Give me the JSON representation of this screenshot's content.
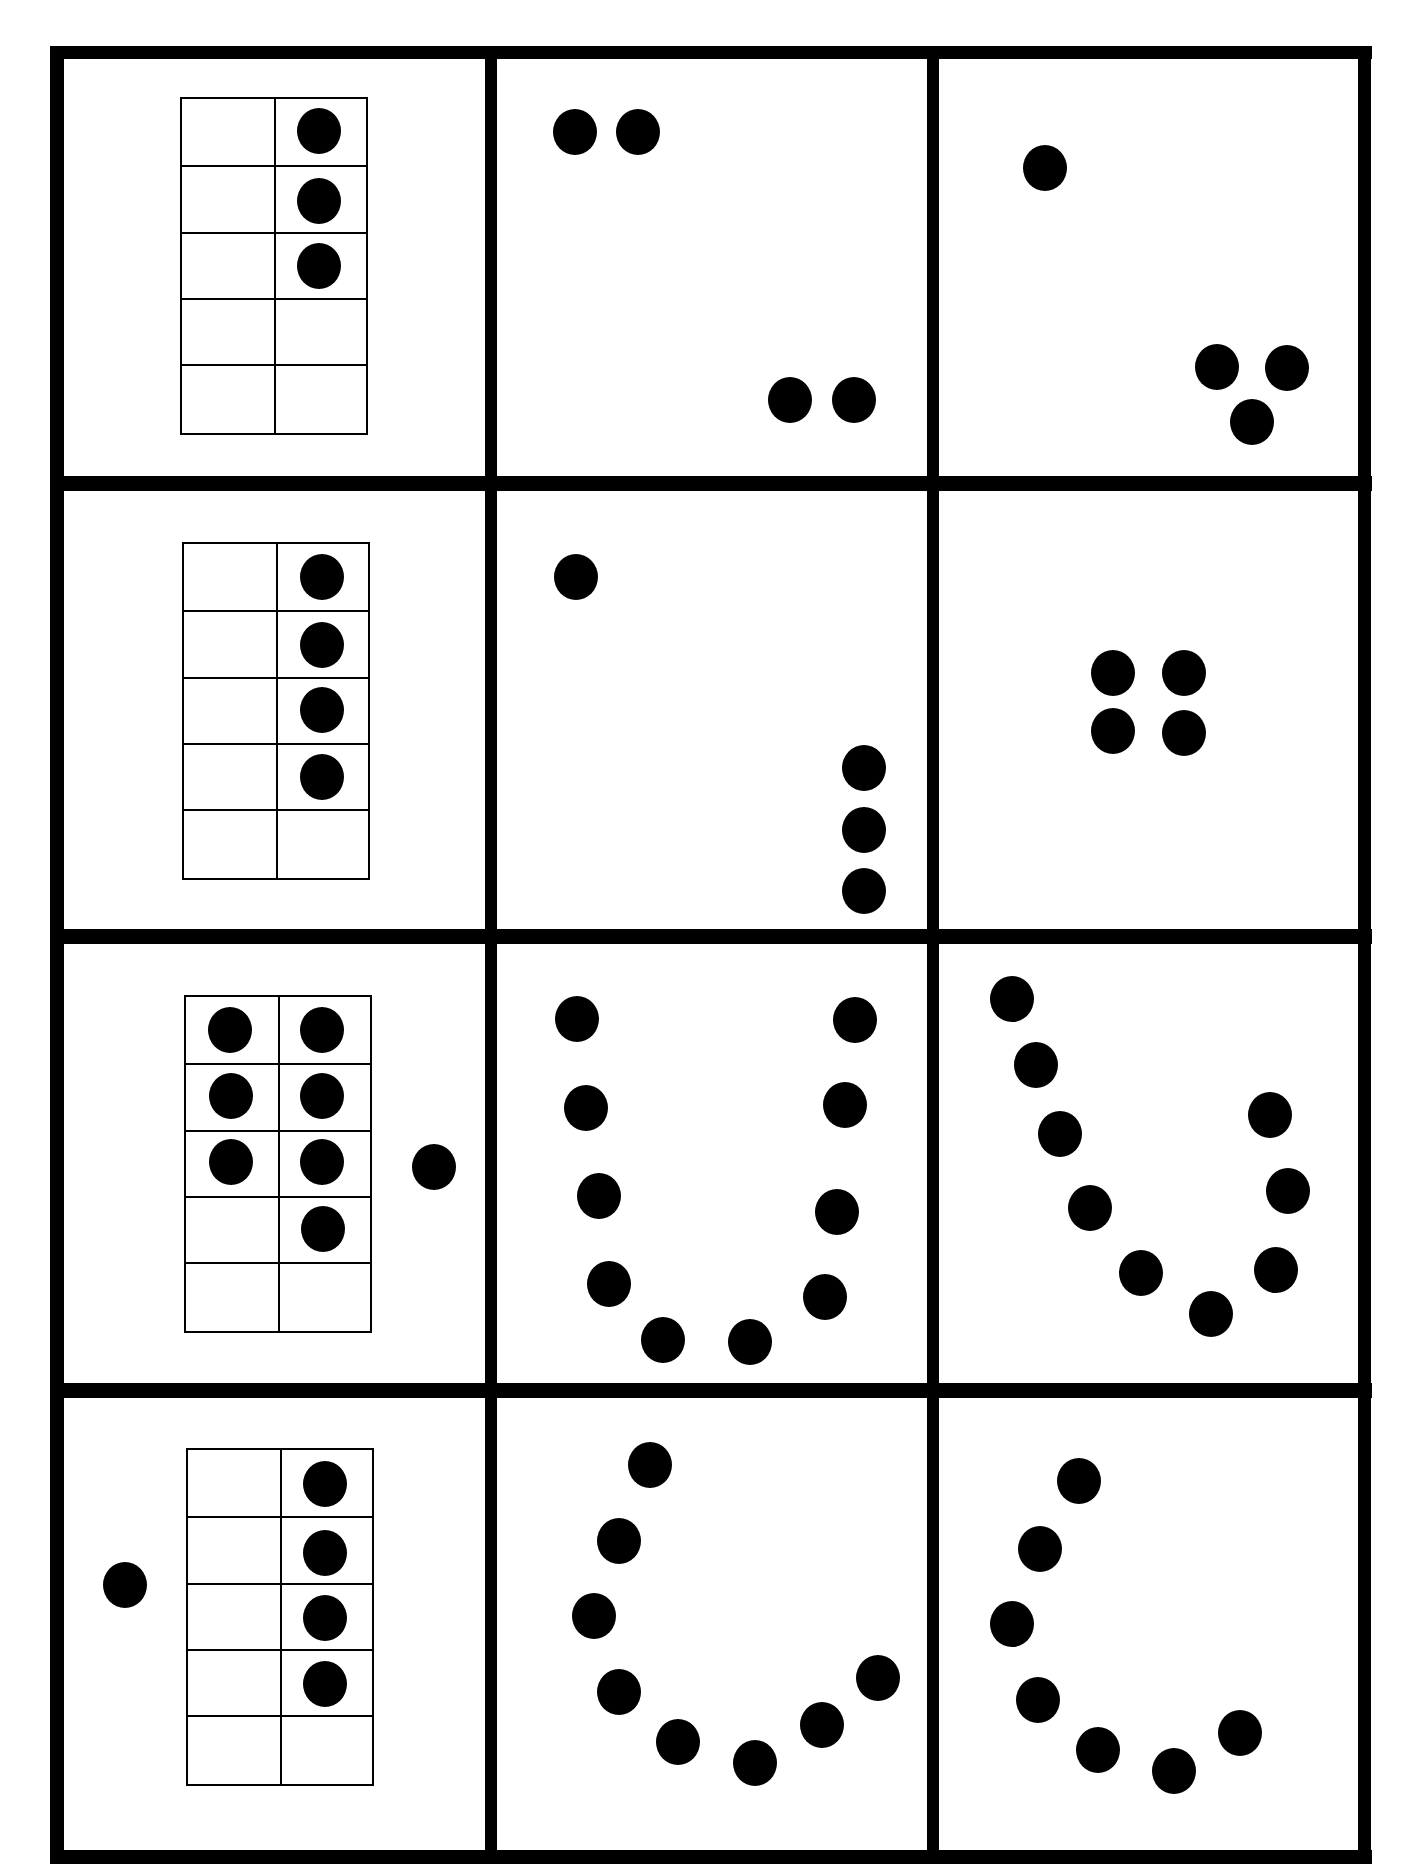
{
  "worksheet": {
    "type": "ten-frame and dot-pattern counting cards",
    "grid": {
      "rows": 4,
      "columns": 3
    },
    "colors": {
      "ink": "#000000",
      "paper": "#ffffff"
    },
    "cards": [
      {
        "row": 0,
        "col": 0,
        "kind": "ten-frame",
        "filled": 3,
        "extra_dots": 0,
        "total": 3
      },
      {
        "row": 0,
        "col": 1,
        "kind": "dots",
        "count": 4,
        "arrangement": "2 top-left + 2 bottom-right"
      },
      {
        "row": 0,
        "col": 2,
        "kind": "dots",
        "count": 4,
        "arrangement": "1 top + 3 bottom-right triangle"
      },
      {
        "row": 1,
        "col": 0,
        "kind": "ten-frame",
        "filled": 4,
        "extra_dots": 0,
        "total": 4
      },
      {
        "row": 1,
        "col": 1,
        "kind": "dots",
        "count": 4,
        "arrangement": "1 top-left + 3 vertical bottom-right"
      },
      {
        "row": 1,
        "col": 2,
        "kind": "dots",
        "count": 4,
        "arrangement": "2x2 square"
      },
      {
        "row": 2,
        "col": 0,
        "kind": "ten-frame",
        "filled": 7,
        "extra_dots": 1,
        "total": 8
      },
      {
        "row": 2,
        "col": 1,
        "kind": "dots",
        "count": 10,
        "arrangement": "U shape"
      },
      {
        "row": 2,
        "col": 2,
        "kind": "dots",
        "count": 10,
        "arrangement": "curved U shape"
      },
      {
        "row": 3,
        "col": 0,
        "kind": "ten-frame",
        "filled": 4,
        "extra_dots": 1,
        "total": 5
      },
      {
        "row": 3,
        "col": 1,
        "kind": "dots",
        "count": 9,
        "arrangement": "J curve"
      },
      {
        "row": 3,
        "col": 2,
        "kind": "dots",
        "count": 7,
        "arrangement": "J curve"
      }
    ]
  }
}
